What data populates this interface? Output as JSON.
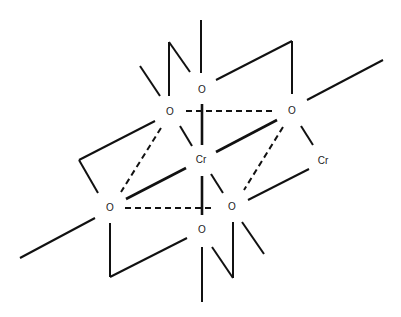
{
  "diagram": {
    "title": "",
    "atoms": [
      {
        "id": "o-top",
        "label": "O",
        "x": 202,
        "y": 90
      },
      {
        "id": "o-upper-left",
        "label": "O",
        "x": 170,
        "y": 112
      },
      {
        "id": "o-upper-right",
        "label": "O",
        "x": 292,
        "y": 111
      },
      {
        "id": "cr-center",
        "label": "Cr",
        "x": 201,
        "y": 160
      },
      {
        "id": "cr-right",
        "label": "Cr",
        "x": 323,
        "y": 161
      },
      {
        "id": "o-lower-left",
        "label": "O",
        "x": 110,
        "y": 208
      },
      {
        "id": "o-lower-right",
        "label": "O",
        "x": 232,
        "y": 207
      },
      {
        "id": "o-bottom",
        "label": "O",
        "x": 202,
        "y": 230
      }
    ],
    "bond_types": [
      "solid",
      "thick-solid",
      "dashed"
    ]
  }
}
